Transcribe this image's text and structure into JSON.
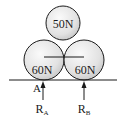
{
  "diagram": {
    "type": "physics-free-body",
    "spheres": [
      {
        "id": "top",
        "label": "50N",
        "cx": 63,
        "cy": 23,
        "r": 17
      },
      {
        "id": "left",
        "label": "60N",
        "cx": 44,
        "cy": 60,
        "r": 20
      },
      {
        "id": "right",
        "label": "60N",
        "cx": 84,
        "cy": 60,
        "r": 20
      }
    ],
    "ground": {
      "y": 80,
      "x1": 9,
      "x2": 117
    },
    "center_line": {
      "y": 57,
      "x1": 44,
      "x2": 84
    },
    "point_label": "A",
    "reactions": [
      {
        "id": "RA",
        "label": "R",
        "subscript": "A",
        "x": 43
      },
      {
        "id": "RB",
        "label": "R",
        "subscript": "B",
        "x": 84
      }
    ],
    "colors": {
      "line": "#1a1a1a",
      "sphere_fill_light": "#f4f4f4",
      "sphere_fill_dark": "#c9c9c9"
    }
  }
}
